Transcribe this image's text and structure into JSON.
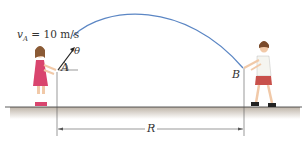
{
  "figure": {
    "velocity_label": {
      "symbol": "v",
      "subscript": "A",
      "equals": " = 10 m/s"
    },
    "angle_label": "θ",
    "point_a_label": "A",
    "point_b_label": "B",
    "range_label": "R",
    "colors": {
      "trajectory": "#5b86c4",
      "girl_dress": "#d9456e",
      "boy_shorts": "#c8504a",
      "ground_shadow": "#cfc6bb",
      "lines": "#444444"
    }
  }
}
